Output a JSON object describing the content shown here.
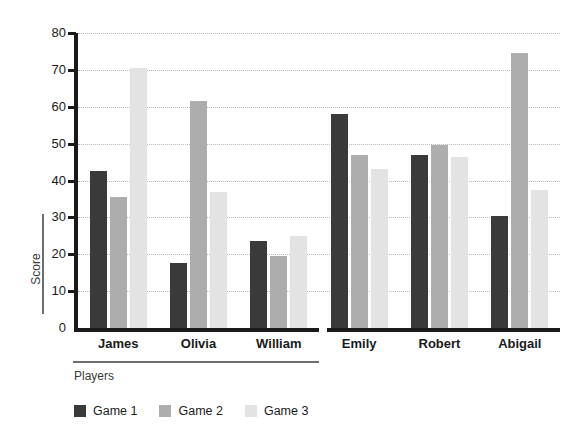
{
  "chart_data": {
    "type": "bar",
    "title": "",
    "xlabel": "Players",
    "ylabel": "Score",
    "categories": [
      "James",
      "Olivia",
      "William",
      "Emily",
      "Robert",
      "Abigail"
    ],
    "series": [
      {
        "name": "Game 1",
        "color": "#3a3a3a",
        "values": [
          42.5,
          17.5,
          23.5,
          58,
          47,
          30.5
        ]
      },
      {
        "name": "Game 2",
        "color": "#adadad",
        "values": [
          35.5,
          61.5,
          19.5,
          47,
          49.5,
          74.5
        ]
      },
      {
        "name": "Game 3",
        "color": "#e3e3e3",
        "values": [
          70.5,
          37,
          25,
          43,
          46.5,
          37.5
        ]
      }
    ],
    "ylim": [
      0,
      80
    ],
    "yticks": [
      0,
      10,
      20,
      30,
      40,
      50,
      60,
      70,
      80
    ],
    "ytick_labels": [
      "0",
      "10",
      "20",
      "30",
      "40",
      "50",
      "60",
      "70",
      "80"
    ],
    "grid": true,
    "grid_axis": "y",
    "legend_position": "bottom-left",
    "axis_split_after": "William"
  },
  "colors": {
    "axis": "#1a1a1a",
    "grid": "#b9b9b9",
    "label_rule": "#6e6e6e",
    "text": "#1a1a1a",
    "background": "#ffffff"
  }
}
